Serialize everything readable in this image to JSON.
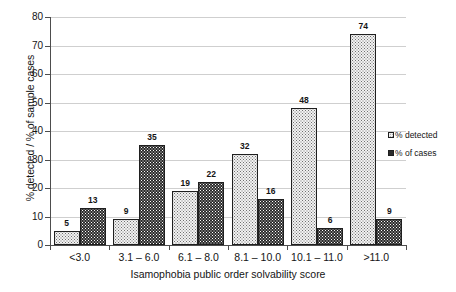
{
  "chart_data": {
    "type": "bar",
    "title": "",
    "xlabel": "Isamophobia public order solvability score",
    "ylabel": "% detected / % of sample cases",
    "categories": [
      "<3.0",
      "3.1 – 6.0",
      "6.1 – 8.0",
      "8.1 – 10.0",
      "10.1 – 11.0",
      ">11.0"
    ],
    "series": [
      {
        "name": "% detected",
        "values": [
          5,
          9,
          19,
          32,
          48,
          74
        ],
        "swatch": "detected"
      },
      {
        "name": "% of cases",
        "values": [
          13,
          35,
          22,
          16,
          6,
          9
        ],
        "swatch": "cases"
      }
    ],
    "ylim": [
      0,
      80
    ],
    "yticks": [
      0,
      10,
      20,
      30,
      40,
      50,
      60,
      70,
      80
    ],
    "ytick_labels": [
      "0",
      "10",
      "20",
      "30",
      "40",
      "50",
      "60",
      "70",
      "80"
    ],
    "grid": true,
    "legend_position": "right",
    "colors": {
      "detected_fill": "#f2f2f2",
      "cases_fill": "#2b2b2b",
      "bar_outline": "#1f1f1f",
      "gridline": "#cfcfcf",
      "axis": "#4d4d4d",
      "text": "#141414",
      "background": "#ffffff"
    }
  },
  "legend": {
    "items": [
      {
        "label": "% detected",
        "swatch": "detected"
      },
      {
        "label": "% of cases",
        "swatch": "cases"
      }
    ]
  }
}
